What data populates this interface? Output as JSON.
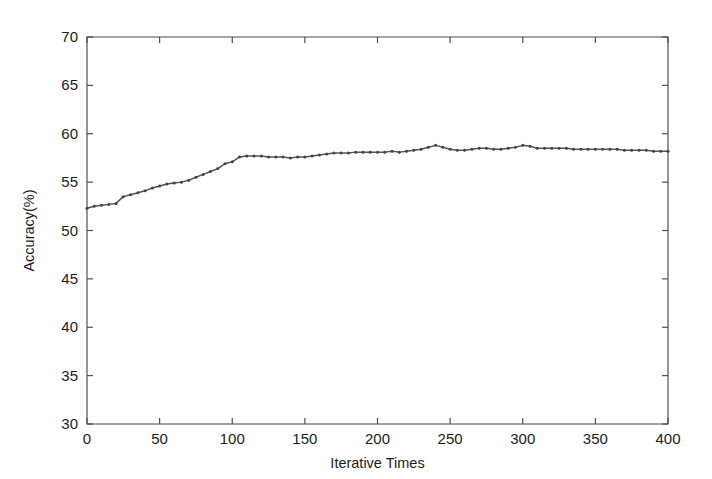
{
  "chart_data": {
    "type": "line",
    "title": "",
    "xlabel": "Iterative Times",
    "ylabel": "Accuracy(%)",
    "xlim": [
      0,
      400
    ],
    "ylim": [
      30,
      70
    ],
    "xticks": [
      0,
      50,
      100,
      150,
      200,
      250,
      300,
      350,
      400
    ],
    "xtick_labels": [
      "0",
      "50",
      "100",
      "150",
      "200",
      "250",
      "300",
      "350",
      "400"
    ],
    "yticks": [
      30,
      35,
      40,
      45,
      50,
      55,
      60,
      65,
      70
    ],
    "ytick_labels": [
      "30",
      "35",
      "40",
      "45",
      "50",
      "55",
      "60",
      "65",
      "70"
    ],
    "grid": false,
    "legend": null,
    "legend_position": "none",
    "line_color": "#555555",
    "marker": "dot",
    "marker_color": "#444444",
    "axes_color": "#4a4a4a",
    "background_color": "#ffffff",
    "series": [
      {
        "name": "Accuracy",
        "x": [
          0,
          5,
          10,
          15,
          20,
          25,
          30,
          35,
          40,
          45,
          50,
          55,
          60,
          65,
          70,
          75,
          80,
          85,
          90,
          95,
          100,
          105,
          110,
          115,
          120,
          125,
          130,
          135,
          140,
          145,
          150,
          155,
          160,
          165,
          170,
          175,
          180,
          185,
          190,
          195,
          200,
          205,
          210,
          215,
          220,
          225,
          230,
          235,
          240,
          245,
          250,
          255,
          260,
          265,
          270,
          275,
          280,
          285,
          290,
          295,
          300,
          305,
          310,
          315,
          320,
          325,
          330,
          335,
          340,
          345,
          350,
          355,
          360,
          365,
          370,
          375,
          380,
          385,
          390,
          395,
          400
        ],
        "values": [
          52.3,
          52.5,
          52.6,
          52.7,
          52.8,
          53.5,
          53.7,
          53.9,
          54.1,
          54.4,
          54.6,
          54.8,
          54.9,
          55.0,
          55.2,
          55.5,
          55.8,
          56.1,
          56.4,
          56.9,
          57.1,
          57.6,
          57.7,
          57.7,
          57.7,
          57.6,
          57.6,
          57.6,
          57.5,
          57.6,
          57.6,
          57.7,
          57.8,
          57.9,
          58.0,
          58.0,
          58.0,
          58.1,
          58.1,
          58.1,
          58.1,
          58.1,
          58.2,
          58.1,
          58.2,
          58.3,
          58.4,
          58.6,
          58.8,
          58.6,
          58.4,
          58.3,
          58.3,
          58.4,
          58.5,
          58.5,
          58.4,
          58.4,
          58.5,
          58.6,
          58.8,
          58.7,
          58.5,
          58.5,
          58.5,
          58.5,
          58.5,
          58.4,
          58.4,
          58.4,
          58.4,
          58.4,
          58.4,
          58.4,
          58.3,
          58.3,
          58.3,
          58.3,
          58.2,
          58.2,
          58.2
        ]
      }
    ]
  }
}
